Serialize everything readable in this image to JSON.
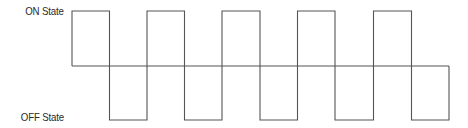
{
  "diagram": {
    "type": "square-wave",
    "labels": {
      "on_state": "ON State",
      "off_state": "OFF State"
    },
    "levels": {
      "on_y": 11,
      "mid_y": 66,
      "off_y": 120
    },
    "edges_x": [
      72,
      109.5,
      147,
      184.5,
      222,
      260,
      297.5,
      335,
      373.5,
      411.5,
      449
    ],
    "sequence": [
      "ON",
      "OFF",
      "ON",
      "OFF",
      "ON",
      "OFF",
      "ON",
      "OFF",
      "ON",
      "OFF"
    ],
    "colors": {
      "line": "#555555",
      "text": "#2a2a2a",
      "background": "#ffffff"
    }
  }
}
